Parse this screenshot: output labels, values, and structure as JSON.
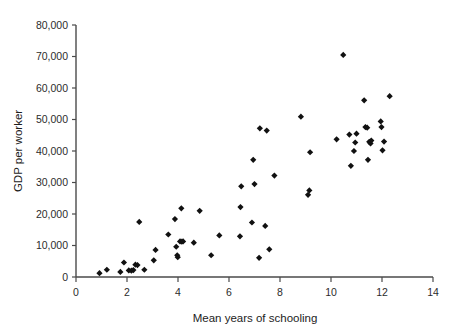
{
  "chart_data": {
    "type": "scatter",
    "title": "",
    "xlabel": "Mean years of schooling",
    "ylabel": "GDP per worker",
    "xlim": [
      0,
      14
    ],
    "ylim": [
      0,
      80000
    ],
    "xticks": [
      0,
      2,
      4,
      6,
      8,
      10,
      12,
      14
    ],
    "xtick_labels": [
      "0",
      "2",
      "4",
      "6",
      "8",
      "10",
      "12",
      "14"
    ],
    "yticks": [
      0,
      10000,
      20000,
      30000,
      40000,
      50000,
      60000,
      70000,
      80000
    ],
    "ytick_labels": [
      "0",
      "10,000",
      "20,000",
      "30,000",
      "40,000",
      "50,000",
      "60,000",
      "70,000",
      "80,000"
    ],
    "grid": false,
    "legend": null,
    "marker": "diamond",
    "marker_color": "#111111",
    "marker_size": 3.1,
    "points": [
      {
        "x": 0.92,
        "y": 1200
      },
      {
        "x": 1.21,
        "y": 2300
      },
      {
        "x": 1.74,
        "y": 1600
      },
      {
        "x": 1.88,
        "y": 4600
      },
      {
        "x": 2.07,
        "y": 2100
      },
      {
        "x": 2.17,
        "y": 2000
      },
      {
        "x": 2.25,
        "y": 2200
      },
      {
        "x": 2.33,
        "y": 3900
      },
      {
        "x": 2.41,
        "y": 3800
      },
      {
        "x": 2.48,
        "y": 17500
      },
      {
        "x": 2.68,
        "y": 2300
      },
      {
        "x": 3.05,
        "y": 5300
      },
      {
        "x": 3.12,
        "y": 8600
      },
      {
        "x": 3.62,
        "y": 13500
      },
      {
        "x": 3.88,
        "y": 18400
      },
      {
        "x": 3.93,
        "y": 9600
      },
      {
        "x": 3.97,
        "y": 6900
      },
      {
        "x": 3.99,
        "y": 6300
      },
      {
        "x": 4.08,
        "y": 11300
      },
      {
        "x": 4.15,
        "y": 11200
      },
      {
        "x": 4.2,
        "y": 11300
      },
      {
        "x": 4.13,
        "y": 21800
      },
      {
        "x": 4.62,
        "y": 10900
      },
      {
        "x": 4.85,
        "y": 21000
      },
      {
        "x": 5.3,
        "y": 6900
      },
      {
        "x": 5.62,
        "y": 13200
      },
      {
        "x": 6.43,
        "y": 12900
      },
      {
        "x": 6.45,
        "y": 22200
      },
      {
        "x": 6.48,
        "y": 28800
      },
      {
        "x": 6.9,
        "y": 17300
      },
      {
        "x": 6.95,
        "y": 37200
      },
      {
        "x": 7.0,
        "y": 29500
      },
      {
        "x": 7.18,
        "y": 6100
      },
      {
        "x": 7.21,
        "y": 47200
      },
      {
        "x": 7.42,
        "y": 16200
      },
      {
        "x": 7.48,
        "y": 46500
      },
      {
        "x": 7.58,
        "y": 8800
      },
      {
        "x": 7.78,
        "y": 32200
      },
      {
        "x": 8.82,
        "y": 50900
      },
      {
        "x": 9.1,
        "y": 26100
      },
      {
        "x": 9.15,
        "y": 27500
      },
      {
        "x": 9.18,
        "y": 39600
      },
      {
        "x": 10.22,
        "y": 43700
      },
      {
        "x": 10.48,
        "y": 70500
      },
      {
        "x": 10.72,
        "y": 45200
      },
      {
        "x": 10.78,
        "y": 35300
      },
      {
        "x": 10.9,
        "y": 40000
      },
      {
        "x": 10.95,
        "y": 42700
      },
      {
        "x": 11.0,
        "y": 45500
      },
      {
        "x": 11.3,
        "y": 56100
      },
      {
        "x": 11.35,
        "y": 47600
      },
      {
        "x": 11.42,
        "y": 47400
      },
      {
        "x": 11.45,
        "y": 37200
      },
      {
        "x": 11.5,
        "y": 42900
      },
      {
        "x": 11.55,
        "y": 42400
      },
      {
        "x": 11.58,
        "y": 43300
      },
      {
        "x": 11.95,
        "y": 49400
      },
      {
        "x": 11.98,
        "y": 47600
      },
      {
        "x": 12.02,
        "y": 40200
      },
      {
        "x": 12.08,
        "y": 43000
      },
      {
        "x": 12.3,
        "y": 57400
      }
    ]
  }
}
